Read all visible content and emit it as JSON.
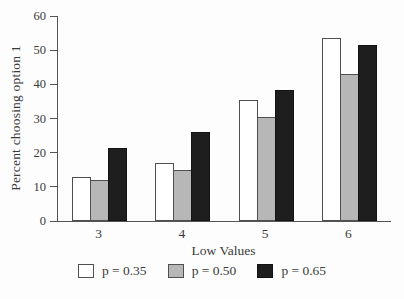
{
  "figure": {
    "background": "#fdfdfd",
    "axis_color": "#555555",
    "text_color": "#3a3a3a"
  },
  "chart_data": {
    "type": "bar",
    "title": "",
    "ylabel": "Percent choosing option 1",
    "xlabel": "Low Values",
    "categories": [
      "3",
      "4",
      "5",
      "6"
    ],
    "series": [
      {
        "name": "p = 0.35",
        "fill": "#ffffff",
        "border": "#4f4f4f",
        "values": [
          13,
          17,
          35.5,
          53.5
        ]
      },
      {
        "name": "p = 0.50",
        "fill": "#b7b7b7",
        "border": "#4f4f4f",
        "values": [
          12,
          15,
          30.5,
          43
        ]
      },
      {
        "name": "p = 0.65",
        "fill": "#1e1e1e",
        "border": "#131313",
        "values": [
          21.5,
          26,
          38.5,
          51.5
        ]
      }
    ],
    "ylim": [
      0,
      60
    ],
    "yticks": [
      0,
      10,
      20,
      30,
      40,
      50,
      60
    ],
    "grid": false,
    "legend_position": "bottom"
  }
}
